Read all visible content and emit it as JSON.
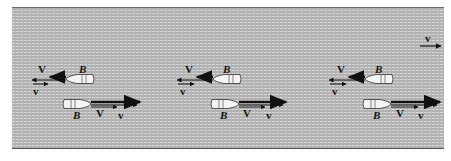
{
  "figure": {
    "colors": {
      "water": "#b4b4b4",
      "water_streak": "#d6d6d6",
      "boat": "#f2f2f2",
      "arrow": "#111111"
    },
    "current": {
      "label": "v"
    },
    "groups": [
      {
        "upper_boat": {
          "label": "B",
          "V_label": "V",
          "v_label": "v"
        },
        "lower_boat": {
          "label": "B",
          "V_label": "V",
          "v_label": "v"
        }
      },
      {
        "upper_boat": {
          "label": "B",
          "V_label": "V",
          "v_label": "v"
        },
        "lower_boat": {
          "label": "B",
          "V_label": "V",
          "v_label": "v"
        }
      },
      {
        "upper_boat": {
          "label": "B",
          "V_label": "V",
          "v_label": "v"
        },
        "lower_boat": {
          "label": "B",
          "V_label": "V",
          "v_label": "v"
        }
      }
    ]
  }
}
